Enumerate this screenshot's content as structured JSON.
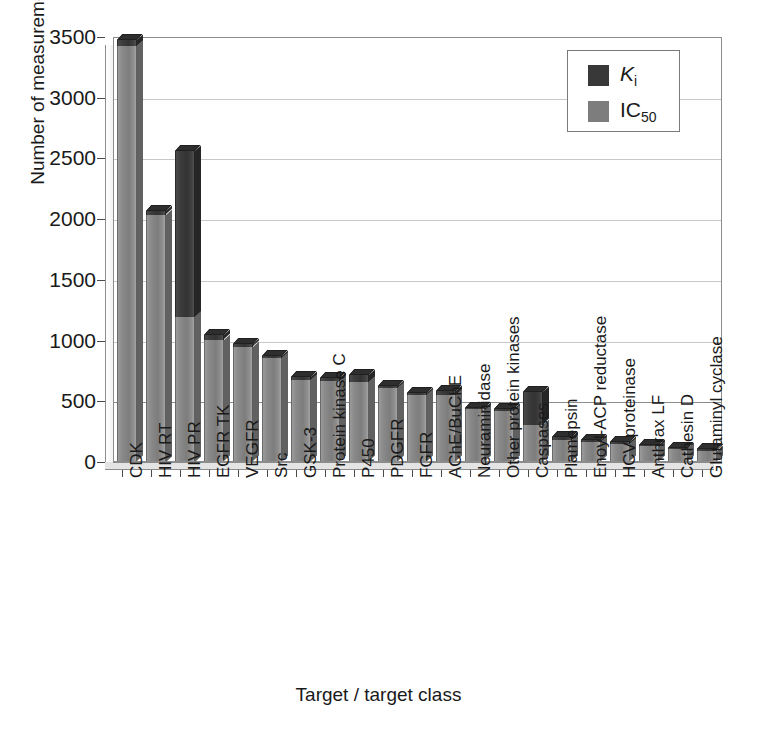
{
  "chart_data": {
    "type": "bar",
    "subtype": "stacked-3d-column",
    "title": "",
    "xlabel": "Target / target class",
    "ylabel": "Number of measurements",
    "ylim": [
      0,
      3500
    ],
    "ytick_step": 500,
    "yticks": [
      "0",
      "500",
      "1000",
      "1500",
      "2000",
      "2500",
      "3000",
      "3500"
    ],
    "grid": true,
    "legend_position": "top-right",
    "legend": [
      {
        "key": "ki",
        "label": "Ki",
        "label_html": "<i>K</i><sub>i</sub>",
        "color": "#383838"
      },
      {
        "key": "ic50",
        "label": "IC50",
        "label_html": "IC<sub>50</sub>",
        "color": "#7d7d7d"
      }
    ],
    "categories": [
      "CDK",
      "HIV RT",
      "HIV PR",
      "EGFR TK",
      "VEGFR",
      "Src",
      "GSK-3",
      "Protein kinase C",
      "P450",
      "PDGFR",
      "FGFR",
      "AChE/BuChE",
      "Neuraminidase",
      "Other protein kinases",
      "Caspases",
      "Plamepsin",
      "Enoyl-ACP reductase",
      "HCV proteinase",
      "Anthrax LF",
      "Cathesin D",
      "Glutaminyl cyclase"
    ],
    "series": [
      {
        "name": "IC50",
        "key": "ic50",
        "values": [
          3420,
          2030,
          1190,
          1000,
          940,
          850,
          670,
          660,
          650,
          600,
          545,
          545,
          425,
          410,
          300,
          170,
          160,
          140,
          120,
          100,
          85
        ]
      },
      {
        "name": "Ki",
        "key": "ki",
        "values": [
          50,
          25,
          1365,
          35,
          20,
          15,
          25,
          25,
          55,
          20,
          15,
          30,
          15,
          20,
          265,
          25,
          15,
          20,
          15,
          10,
          10
        ]
      }
    ],
    "totals": [
      3470,
      2055,
      2555,
      1035,
      960,
      865,
      695,
      685,
      705,
      620,
      560,
      575,
      440,
      430,
      565,
      195,
      175,
      160,
      135,
      110,
      95
    ]
  }
}
